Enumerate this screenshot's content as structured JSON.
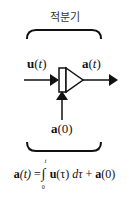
{
  "diagram": {
    "title": "적분기",
    "input_label": {
      "bold": "u",
      "paren_open": "(",
      "var": "t",
      "paren_close": ")"
    },
    "output_label": {
      "bold": "a",
      "paren_open": "(",
      "var": "t",
      "paren_close": ")"
    },
    "initial_label": {
      "bold": "a",
      "rest": "(0)"
    },
    "formula": {
      "lhs_bold": "a",
      "lhs_var": "(t)",
      "equals": "=",
      "integral": "∫",
      "upper_limit": "t",
      "lower_limit": "0",
      "integrand_bold": "u",
      "integrand_rest": "(τ)",
      "differential": "dτ",
      "plus": "+",
      "const_bold": "a",
      "const_rest": "(0)"
    },
    "colors": {
      "line": "#111111",
      "text": "#111111"
    }
  }
}
